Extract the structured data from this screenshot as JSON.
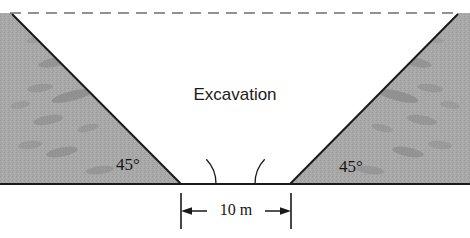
{
  "figure": {
    "region_label": "Excavation",
    "angle_left_label": "45°",
    "angle_right_label": "45°",
    "dimension_label": "10 m",
    "colors": {
      "soil_fill": "#a8a8a8",
      "soil_speckle": "#8d8d8d",
      "outline": "#1a1a1a",
      "ground_surface_dashed": "#6f6f6f",
      "text": "#141414",
      "background": "#ffffff"
    },
    "geometry": {
      "ground_surface_y": 13,
      "ground_surface_x_start": 10,
      "ground_surface_x_end": 460,
      "baseline_y": 184,
      "left_apex_x": 12,
      "right_apex_x": 458,
      "trench_bottom_left_x": 181,
      "trench_bottom_right_x": 290,
      "angle_arc_radius": 35,
      "dimension_line_y": 211,
      "dimension_tick_left_x": 181,
      "dimension_tick_right_x": 291,
      "slope_angle_degrees": 45,
      "trench_width_meters": 10
    }
  }
}
